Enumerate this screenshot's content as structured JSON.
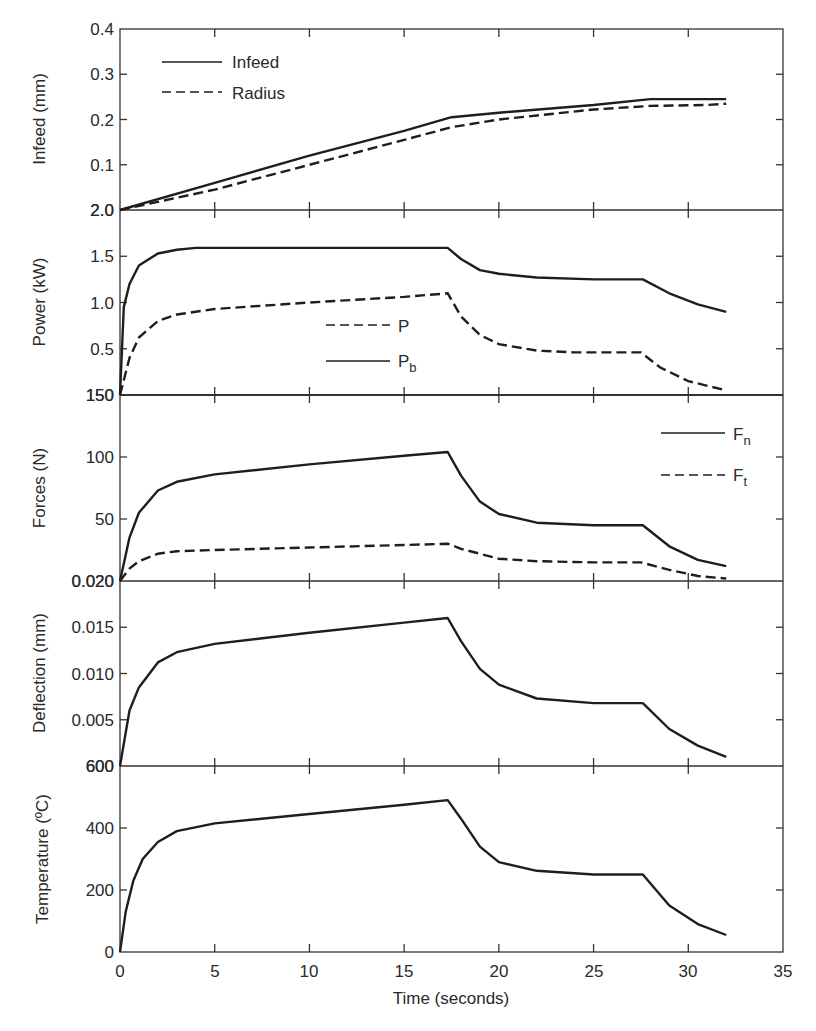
{
  "chart_data": {
    "type": "line",
    "layout": "5 vertically stacked panels sharing x axis",
    "xlabel": "Time (seconds)",
    "xlim": [
      0,
      35
    ],
    "xticks": [
      0,
      5,
      10,
      15,
      20,
      25,
      30,
      35
    ],
    "grid": false,
    "panels": [
      {
        "id": "infeed",
        "ylabel": "Infeed (mm)",
        "ylim": [
          0,
          0.4
        ],
        "ytick_labels": [
          "2.0",
          "0.1",
          "0.2",
          "0.3",
          "0.4"
        ],
        "ytick_values": [
          0,
          0.1,
          0.2,
          0.3,
          0.4
        ],
        "legend": [
          "Infeed",
          "Radius"
        ],
        "legend_position": "upper left",
        "series": [
          {
            "name": "Infeed",
            "style": "solid",
            "x": [
              0,
              5,
              10,
              15,
              17.5,
              20,
              25,
              28,
              32
            ],
            "values": [
              0,
              0.06,
              0.12,
              0.175,
              0.205,
              0.215,
              0.232,
              0.245,
              0.245
            ]
          },
          {
            "name": "Radius",
            "style": "dashed",
            "x": [
              0,
              5,
              10,
              15,
              17.5,
              20,
              25,
              28,
              31,
              32
            ],
            "values": [
              0,
              0.045,
              0.1,
              0.155,
              0.183,
              0.2,
              0.222,
              0.23,
              0.232,
              0.235
            ]
          }
        ]
      },
      {
        "id": "power",
        "ylabel": "Power (kW)",
        "ylim": [
          0,
          2.0
        ],
        "ytick_labels": [
          "150",
          "0.5",
          "1.0",
          "1.5",
          "2.0"
        ],
        "ytick_values": [
          0,
          0.5,
          1.0,
          1.5,
          2.0
        ],
        "legend": [
          "P",
          "Pb"
        ],
        "legend_position": "center",
        "series": [
          {
            "name": "P",
            "style": "dashed",
            "x": [
              0,
              0.5,
              1,
              2,
              3,
              5,
              10,
              15,
              17.3,
              18,
              19,
              20,
              22,
              24,
              27.5,
              28.5,
              30,
              32
            ],
            "values": [
              0,
              0.4,
              0.62,
              0.8,
              0.87,
              0.93,
              1.0,
              1.06,
              1.1,
              0.85,
              0.65,
              0.55,
              0.48,
              0.46,
              0.46,
              0.3,
              0.15,
              0.05
            ]
          },
          {
            "name": "Pb",
            "style": "solid",
            "x": [
              0,
              0.2,
              0.5,
              1,
              2,
              3,
              4,
              10,
              17.3,
              18,
              19,
              20,
              22,
              25,
              27.6,
              29,
              30.5,
              32
            ],
            "values": [
              0,
              0.95,
              1.2,
              1.4,
              1.53,
              1.57,
              1.59,
              1.59,
              1.59,
              1.47,
              1.35,
              1.31,
              1.27,
              1.25,
              1.25,
              1.1,
              0.98,
              0.9
            ]
          }
        ]
      },
      {
        "id": "forces",
        "ylabel": "Forces (N)",
        "ylim": [
          0,
          150
        ],
        "ytick_labels": [
          "0.020",
          "50",
          "100",
          "150"
        ],
        "ytick_values": [
          0,
          50,
          100,
          150
        ],
        "legend": [
          "Fn",
          "Ft"
        ],
        "legend_position": "upper right",
        "series": [
          {
            "name": "Fn",
            "style": "solid",
            "x": [
              0,
              0.5,
              1,
              2,
              3,
              5,
              10,
              15,
              17.3,
              18,
              19,
              20,
              22,
              25,
              27.6,
              29,
              30.5,
              32
            ],
            "values": [
              0,
              35,
              55,
              73,
              80,
              86,
              94,
              101,
              104,
              85,
              64,
              54,
              47,
              45,
              45,
              28,
              17,
              12
            ]
          },
          {
            "name": "Ft",
            "style": "dashed",
            "x": [
              0,
              0.5,
              1,
              2,
              3,
              5,
              10,
              15,
              17.3,
              18,
              20,
              22,
              25,
              27.5,
              29,
              30.5,
              32
            ],
            "values": [
              0,
              10,
              16,
              22,
              24,
              25,
              27,
              29,
              30,
              26,
              18,
              16,
              15,
              15,
              9,
              4,
              2
            ]
          }
        ]
      },
      {
        "id": "deflection",
        "ylabel": "Deflection (mm)",
        "ylim": [
          0,
          0.02
        ],
        "ytick_labels": [
          "600",
          "0.005",
          "0.010",
          "0.015",
          "0.020"
        ],
        "ytick_values": [
          0,
          0.005,
          0.01,
          0.015,
          0.02
        ],
        "series": [
          {
            "name": "Deflection",
            "style": "solid",
            "x": [
              0,
              0.5,
              1,
              2,
              3,
              5,
              10,
              15,
              17.3,
              18,
              19,
              20,
              22,
              25,
              27.6,
              29,
              30.5,
              32
            ],
            "values": [
              0,
              0.006,
              0.0085,
              0.0112,
              0.0123,
              0.0132,
              0.0144,
              0.0155,
              0.016,
              0.0135,
              0.0105,
              0.0088,
              0.0073,
              0.0068,
              0.0068,
              0.004,
              0.0022,
              0.001
            ]
          }
        ]
      },
      {
        "id": "temperature",
        "ylabel": "Temperature (ºC)",
        "ylim": [
          0,
          600
        ],
        "ytick_labels": [
          "0",
          "200",
          "400",
          "600"
        ],
        "ytick_values": [
          0,
          200,
          400,
          600
        ],
        "series": [
          {
            "name": "Temperature",
            "style": "solid",
            "x": [
              0,
              0.3,
              0.7,
              1.2,
              2,
              3,
              5,
              10,
              15,
              17.3,
              18,
              19,
              20,
              22,
              25,
              27.6,
              29,
              30.5,
              32
            ],
            "values": [
              0,
              130,
              230,
              300,
              355,
              390,
              415,
              445,
              475,
              490,
              430,
              340,
              290,
              262,
              250,
              250,
              150,
              90,
              55
            ]
          }
        ]
      }
    ]
  },
  "labels": {
    "xlabel": "Time (seconds)",
    "x_ticks": [
      "0",
      "5",
      "10",
      "15",
      "20",
      "25",
      "30",
      "35"
    ],
    "panel1": {
      "ylabel": "Infeed (mm)",
      "ticks": [
        "2.0",
        "0.1",
        "0.2",
        "0.3",
        "0.4"
      ],
      "legend": [
        "Infeed",
        "Radius"
      ]
    },
    "panel2": {
      "ylabel": "Power (kW)",
      "ticks": [
        "150",
        "0.5",
        "1.0",
        "1.5",
        "2.0"
      ],
      "legend_main": [
        "P",
        "P"
      ],
      "legend_sub": [
        "",
        "b"
      ]
    },
    "panel3": {
      "ylabel": "Forces (N)",
      "ticks": [
        "0.020",
        "50",
        "100",
        "150"
      ],
      "legend_main": [
        "F",
        "F"
      ],
      "legend_sub": [
        "n",
        "t"
      ]
    },
    "panel4": {
      "ylabel": "Deflection (mm)",
      "ticks": [
        "600",
        "0.005",
        "0.010",
        "0.015",
        "0.020"
      ]
    },
    "panel5": {
      "ylabel": "Temperature (ºC)",
      "ticks": [
        "0",
        "200",
        "400",
        "600"
      ]
    }
  }
}
